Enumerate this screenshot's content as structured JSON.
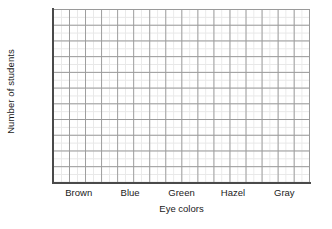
{
  "chart_data": {
    "type": "bar",
    "title": "",
    "subtitle": "",
    "xlabel": "Eye colors",
    "ylabel": "Number of students",
    "categories": [
      "Brown",
      "Blue",
      "Green",
      "Hazel",
      "Gray"
    ],
    "values": [
      null,
      null,
      null,
      null,
      null
    ],
    "series": [
      {
        "name": "Number of students",
        "values": [
          null,
          null,
          null,
          null,
          null
        ]
      }
    ],
    "annotations": [],
    "legend": {
      "visible": false,
      "position": "none",
      "entries": []
    },
    "grid": {
      "visible": true,
      "major_columns": 16,
      "major_rows": 11,
      "minor_subdivisions": 2,
      "major_color": "#9a9a9a",
      "minor_color": "#e8e8e8"
    },
    "axes": {
      "x_tick_labels": [
        "Brown",
        "Blue",
        "Green",
        "Hazel",
        "Gray"
      ],
      "y_tick_labels": [],
      "x_range": null,
      "y_range": null,
      "axis_line_color": "#4a4a4a"
    },
    "note": "Blank grid template with no bars drawn"
  },
  "figure": {
    "y_axis_title": "Number of students",
    "x_axis_title": "Eye colors",
    "x_labels": [
      "Brown",
      "Blue",
      "Green",
      "Hazel",
      "Gray"
    ],
    "background_color": "#ffffff",
    "text_color": "#1a1a1a"
  }
}
